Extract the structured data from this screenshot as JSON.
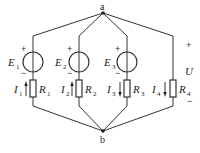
{
  "diagram": {
    "type": "circuit",
    "nodes": {
      "top": {
        "label": "a"
      },
      "bottom": {
        "label": "b"
      }
    },
    "branches": [
      {
        "source": {
          "name": "E",
          "sub": "1",
          "plus": "+",
          "minus": "−"
        },
        "current": {
          "name": "I",
          "sub": "1",
          "direction": "up"
        },
        "resistor": {
          "name": "R",
          "sub": "1"
        }
      },
      {
        "source": {
          "name": "E",
          "sub": "2",
          "plus": "+",
          "minus": "−"
        },
        "current": {
          "name": "I",
          "sub": "2",
          "direction": "up"
        },
        "resistor": {
          "name": "R",
          "sub": "2"
        }
      },
      {
        "source": {
          "name": "E",
          "sub": "3",
          "plus": "+",
          "minus": "−"
        },
        "current": {
          "name": "I",
          "sub": "3",
          "direction": "down"
        },
        "resistor": {
          "name": "R",
          "sub": "3"
        }
      },
      {
        "source": null,
        "current": {
          "name": "I",
          "sub": "4",
          "direction": "down"
        },
        "resistor": {
          "name": "R",
          "sub": "4"
        }
      }
    ],
    "voltage": {
      "name": "U",
      "plus": "+",
      "minus": "−"
    },
    "colors": {
      "line": "#333333",
      "background": "#ffffff"
    }
  }
}
